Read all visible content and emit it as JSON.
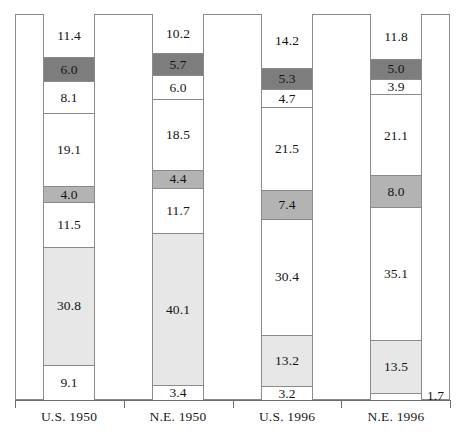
{
  "chart_data": {
    "type": "bar",
    "subtype": "stacked-100-percent",
    "title": "",
    "subtitle": "",
    "xlabel": "",
    "ylabel": "",
    "ylim": [
      0,
      100
    ],
    "grid": false,
    "legend": "none",
    "categories": [
      "U.S. 1950",
      "N.E. 1950",
      "U.S. 1996",
      "N.E. 1996"
    ],
    "stack_order": "bottom-to-top",
    "series": [
      {
        "name": "segment-1",
        "shade": "white",
        "values": [
          9.1,
          3.4,
          3.2,
          1.7
        ]
      },
      {
        "name": "segment-2",
        "shade": "light",
        "values": [
          30.8,
          40.1,
          13.2,
          13.5
        ]
      },
      {
        "name": "segment-3",
        "shade": "white",
        "values": [
          11.5,
          11.7,
          30.4,
          35.1
        ]
      },
      {
        "name": "segment-4",
        "shade": "mid",
        "values": [
          4.0,
          4.4,
          7.4,
          8.0
        ]
      },
      {
        "name": "segment-5",
        "shade": "white",
        "values": [
          19.1,
          18.5,
          21.5,
          21.1
        ]
      },
      {
        "name": "segment-6",
        "shade": "white",
        "values": [
          8.1,
          6.0,
          4.7,
          3.9
        ]
      },
      {
        "name": "segment-7",
        "shade": "dark",
        "values": [
          6.0,
          5.7,
          5.3,
          5.0
        ]
      },
      {
        "name": "segment-8",
        "shade": "white",
        "values": [
          11.4,
          10.2,
          14.2,
          11.8
        ]
      }
    ],
    "bars": [
      {
        "category": "U.S. 1950",
        "total": 100.0,
        "segments": [
          {
            "value": 11.4,
            "label": "11.4",
            "shade": "white",
            "label_position": "inside"
          },
          {
            "value": 6.0,
            "label": "6.0",
            "shade": "dark",
            "label_position": "inside"
          },
          {
            "value": 8.1,
            "label": "8.1",
            "shade": "white",
            "label_position": "inside"
          },
          {
            "value": 19.1,
            "label": "19.1",
            "shade": "white",
            "label_position": "inside"
          },
          {
            "value": 4.0,
            "label": "4.0",
            "shade": "mid",
            "label_position": "inside"
          },
          {
            "value": 11.5,
            "label": "11.5",
            "shade": "white",
            "label_position": "inside"
          },
          {
            "value": 30.8,
            "label": "30.8",
            "shade": "light",
            "label_position": "inside"
          },
          {
            "value": 9.1,
            "label": "9.1",
            "shade": "white",
            "label_position": "inside"
          }
        ]
      },
      {
        "category": "N.E. 1950",
        "total": 100.0,
        "segments": [
          {
            "value": 10.2,
            "label": "10.2",
            "shade": "white",
            "label_position": "inside"
          },
          {
            "value": 5.7,
            "label": "5.7",
            "shade": "dark",
            "label_position": "inside"
          },
          {
            "value": 6.0,
            "label": "6.0",
            "shade": "white",
            "label_position": "inside"
          },
          {
            "value": 18.5,
            "label": "18.5",
            "shade": "white",
            "label_position": "inside"
          },
          {
            "value": 4.4,
            "label": "4.4",
            "shade": "mid",
            "label_position": "inside"
          },
          {
            "value": 11.7,
            "label": "11.7",
            "shade": "white",
            "label_position": "inside"
          },
          {
            "value": 40.1,
            "label": "40.1",
            "shade": "light",
            "label_position": "inside"
          },
          {
            "value": 3.4,
            "label": "3.4",
            "shade": "white",
            "label_position": "inside"
          }
        ]
      },
      {
        "category": "U.S. 1996",
        "total": 99.9,
        "segments": [
          {
            "value": 14.2,
            "label": "14.2",
            "shade": "white",
            "label_position": "inside"
          },
          {
            "value": 5.3,
            "label": "5.3",
            "shade": "dark",
            "label_position": "inside"
          },
          {
            "value": 4.7,
            "label": "4.7",
            "shade": "white",
            "label_position": "inside"
          },
          {
            "value": 21.5,
            "label": "21.5",
            "shade": "white",
            "label_position": "inside"
          },
          {
            "value": 7.4,
            "label": "7.4",
            "shade": "mid",
            "label_position": "inside"
          },
          {
            "value": 30.4,
            "label": "30.4",
            "shade": "white",
            "label_position": "inside"
          },
          {
            "value": 13.2,
            "label": "13.2",
            "shade": "light",
            "label_position": "inside"
          },
          {
            "value": 3.2,
            "label": "3.2",
            "shade": "white",
            "label_position": "inside"
          }
        ]
      },
      {
        "category": "N.E. 1996",
        "total": 100.1,
        "segments": [
          {
            "value": 11.8,
            "label": "11.8",
            "shade": "white",
            "label_position": "inside"
          },
          {
            "value": 5.0,
            "label": "5.0",
            "shade": "dark",
            "label_position": "inside"
          },
          {
            "value": 3.9,
            "label": "3.9",
            "shade": "white",
            "label_position": "inside"
          },
          {
            "value": 21.1,
            "label": "21.1",
            "shade": "white",
            "label_position": "inside"
          },
          {
            "value": 8.0,
            "label": "8.0",
            "shade": "mid",
            "label_position": "inside"
          },
          {
            "value": 35.1,
            "label": "35.1",
            "shade": "white",
            "label_position": "inside"
          },
          {
            "value": 13.5,
            "label": "13.5",
            "shade": "light",
            "label_position": "inside"
          },
          {
            "value": 1.7,
            "label": "1.7",
            "shade": "white",
            "label_position": "outside-right"
          }
        ]
      }
    ],
    "colors": {
      "white": "#ffffff",
      "light": "#e7e7e7",
      "mid": "#b3b3b3",
      "dark": "#7d7d7d",
      "outline": "#8a8a8a",
      "axis": "#6e6e6e",
      "text": "#141414"
    }
  }
}
